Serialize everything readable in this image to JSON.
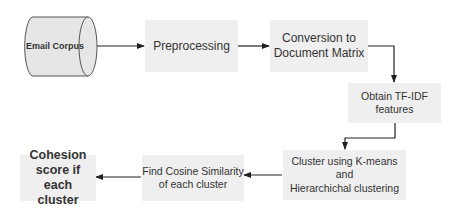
{
  "diagram": {
    "type": "flowchart",
    "nodes": [
      {
        "id": "email_corpus",
        "label": "Email Corpus",
        "shape": "cylinder"
      },
      {
        "id": "preprocessing",
        "label": "Preprocessing",
        "shape": "rect"
      },
      {
        "id": "conversion",
        "label": "Conversion to\nDocument Matrix",
        "shape": "rect"
      },
      {
        "id": "tfidf",
        "label": "Obtain TF-IDF\nfeatures",
        "shape": "rect"
      },
      {
        "id": "cluster",
        "label": "Cluster using K-means and\nHierarchichal clustering",
        "shape": "rect"
      },
      {
        "id": "cosine",
        "label": "Find Cosine Similarity\nof each cluster",
        "shape": "rect"
      },
      {
        "id": "cohesion",
        "label": "Cohesion\nscore if each\ncluster",
        "shape": "rect"
      }
    ],
    "edges": [
      {
        "from": "email_corpus",
        "to": "preprocessing"
      },
      {
        "from": "preprocessing",
        "to": "conversion"
      },
      {
        "from": "conversion",
        "to": "tfidf"
      },
      {
        "from": "tfidf",
        "to": "cluster"
      },
      {
        "from": "cluster",
        "to": "cosine"
      },
      {
        "from": "cosine",
        "to": "cohesion"
      }
    ],
    "colors": {
      "box_fill": "#efefef",
      "cylinder_fill": "#e6e6e6",
      "stroke": "#333333",
      "text": "#333333"
    }
  }
}
